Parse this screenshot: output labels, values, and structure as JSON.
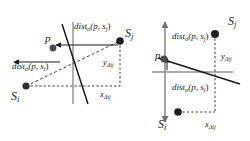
{
  "figure": {
    "caption": "",
    "background_color": "#ffffff",
    "line_color_primary": "#1a1a1a",
    "line_color_secondary": "#8c8c8c",
    "point_color": "#3d3d3d",
    "panels": [
      {
        "id": "left-panel",
        "name": "left-diagram",
        "labels": {
          "p": "p",
          "s_i": "S",
          "s_i_sub": "i",
          "s_j": "S",
          "s_j_sub": "j",
          "dist_upper": "dist",
          "dist_upper_sub_o": "o",
          "dist_upper_args": "(p, s",
          "dist_upper_arg_sub": "j",
          "dist_upper_close": ")",
          "dist_lower": "dist",
          "dist_lower_sub_o": "o",
          "dist_lower_args": "(p, s",
          "dist_lower_arg_sub": "i",
          "dist_lower_close": ")",
          "y_delta": "y",
          "y_delta_sub": "Δij",
          "x_delta": "x",
          "x_delta_sub": "Δij"
        }
      },
      {
        "id": "right-panel",
        "name": "right-diagram",
        "labels": {
          "p": "p",
          "s_i": "S",
          "s_i_sub": "i",
          "s_j": "S",
          "s_j_sub": "j",
          "dist_upper": "dist",
          "dist_upper_sub_o": "o",
          "dist_upper_args": "(p, s",
          "dist_upper_arg_sub": "j",
          "dist_upper_close": ")",
          "dist_lower": "dist",
          "dist_lower_sub_o": "o",
          "dist_lower_args": "(p, s",
          "dist_lower_arg_sub": "i",
          "dist_lower_close": ")",
          "y_delta": "y",
          "y_delta_sub": "Δij",
          "x_delta": "x",
          "x_delta_sub": "Δij"
        }
      }
    ]
  }
}
